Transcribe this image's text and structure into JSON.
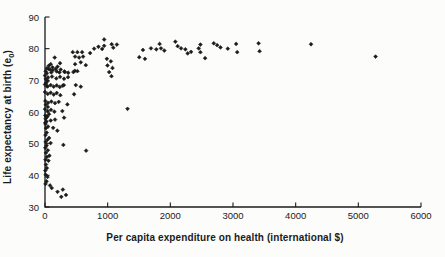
{
  "figure": {
    "background": "#fcfcfb",
    "ink": "#1b1b1b"
  },
  "chart_data": {
    "type": "scatter",
    "title": "",
    "xlabel": "Per capita expenditure on health (international $)",
    "ylabel": "Life expectancy at birth (e0)",
    "ylabel_parts": {
      "main": "Life expectancy at birth (e",
      "sub": "0",
      "close": ")"
    },
    "xlim": [
      0,
      6000
    ],
    "ylim": [
      30,
      90
    ],
    "x_ticks": [
      0,
      1000,
      2000,
      3000,
      4000,
      5000,
      6000
    ],
    "y_ticks": [
      30,
      40,
      50,
      60,
      70,
      80,
      90
    ],
    "grid": false,
    "legend": null,
    "marker": "diamond",
    "marker_color": "#1b1b1b",
    "points": [
      [
        5275,
        77.5
      ],
      [
        4245,
        81.4
      ],
      [
        3408,
        81.7
      ],
      [
        3424,
        79.2
      ],
      [
        3050,
        81.5
      ],
      [
        3067,
        78.9
      ],
      [
        2917,
        80.0
      ],
      [
        2800,
        80.4
      ],
      [
        2747,
        81.1
      ],
      [
        2693,
        81.7
      ],
      [
        2555,
        77.0
      ],
      [
        2480,
        81.3
      ],
      [
        2480,
        78.9
      ],
      [
        2453,
        80.1
      ],
      [
        2331,
        79.0
      ],
      [
        2277,
        78.5
      ],
      [
        2240,
        79.8
      ],
      [
        2171,
        80.1
      ],
      [
        2117,
        80.8
      ],
      [
        2080,
        82.2
      ],
      [
        1563,
        79.6
      ],
      [
        1691,
        80.1
      ],
      [
        1776,
        79.8
      ],
      [
        1829,
        81.5
      ],
      [
        1851,
        80.1
      ],
      [
        1904,
        79.4
      ],
      [
        1504,
        77.3
      ],
      [
        1595,
        76.8
      ],
      [
        1317,
        61.0
      ],
      [
        944,
        82.9
      ],
      [
        944,
        80.9
      ],
      [
        1064,
        81.4
      ],
      [
        1090,
        80.3
      ],
      [
        1147,
        81.3
      ],
      [
        720,
        78.6
      ],
      [
        784,
        80.0
      ],
      [
        853,
        80.6
      ],
      [
        912,
        79.9
      ],
      [
        987,
        76.8
      ],
      [
        1051,
        76.0
      ],
      [
        997,
        74.7
      ],
      [
        1077,
        73.9
      ],
      [
        1024,
        72.6
      ],
      [
        1061,
        71.3
      ],
      [
        443,
        78.9
      ],
      [
        517,
        78.9
      ],
      [
        592,
        78.9
      ],
      [
        480,
        77.5
      ],
      [
        544,
        77.2
      ],
      [
        608,
        77.5
      ],
      [
        651,
        74.8
      ],
      [
        480,
        75.1
      ],
      [
        571,
        75.7
      ],
      [
        491,
        68.5
      ],
      [
        571,
        68.0
      ],
      [
        517,
        72.9
      ],
      [
        475,
        73.0
      ],
      [
        464,
        65.6
      ],
      [
        453,
        72.6
      ],
      [
        656,
        47.8
      ],
      [
        293,
        49.6
      ],
      [
        155,
        77.2
      ],
      [
        240,
        75.4
      ],
      [
        197,
        54.1
      ],
      [
        357,
        62.4
      ],
      [
        277,
        60.3
      ],
      [
        304,
        58.2
      ],
      [
        245,
        65.3
      ],
      [
        300,
        68.5
      ],
      [
        310,
        72.8
      ],
      [
        370,
        72.4
      ],
      [
        230,
        72.5
      ],
      [
        187,
        72.8
      ],
      [
        251,
        73.4
      ],
      [
        315,
        72.6
      ],
      [
        180,
        70.6
      ],
      [
        240,
        71.1
      ],
      [
        304,
        70.5
      ],
      [
        368,
        71.0
      ],
      [
        187,
        68.4
      ],
      [
        235,
        67.9
      ],
      [
        283,
        68.3
      ],
      [
        187,
        66.0
      ],
      [
        160,
        62.8
      ],
      [
        219,
        63.2
      ],
      [
        150,
        60.1
      ],
      [
        160,
        57.6
      ],
      [
        200,
        74.3
      ],
      [
        170,
        73.6
      ],
      [
        91,
        75.1
      ],
      [
        60,
        74.6
      ],
      [
        120,
        74.1
      ],
      [
        30,
        73.8
      ],
      [
        80,
        73.4
      ],
      [
        11,
        72.9
      ],
      [
        59,
        73.6
      ],
      [
        123,
        73.2
      ],
      [
        100,
        72.5
      ],
      [
        30,
        72.2
      ],
      [
        0,
        71.5
      ],
      [
        48,
        70.9
      ],
      [
        112,
        71.2
      ],
      [
        20,
        69.2
      ],
      [
        42,
        69.8
      ],
      [
        12,
        70.4
      ],
      [
        0,
        68.7
      ],
      [
        43,
        68.1
      ],
      [
        91,
        68.5
      ],
      [
        139,
        68.0
      ],
      [
        32,
        68.1
      ],
      [
        0,
        66.3
      ],
      [
        43,
        65.7
      ],
      [
        91,
        66.1
      ],
      [
        139,
        65.5
      ],
      [
        5,
        63.5
      ],
      [
        48,
        62.9
      ],
      [
        101,
        63.3
      ],
      [
        12,
        62.3
      ],
      [
        0,
        60.9
      ],
      [
        43,
        60.3
      ],
      [
        96,
        60.7
      ],
      [
        45,
        61.6
      ],
      [
        91,
        57.3
      ],
      [
        27,
        58.4
      ],
      [
        5,
        58.9
      ],
      [
        64,
        59.3
      ],
      [
        10,
        57.9
      ],
      [
        35,
        58.6
      ],
      [
        8,
        56.2
      ],
      [
        48,
        55.4
      ],
      [
        15,
        54.9
      ],
      [
        28,
        53.5
      ],
      [
        8,
        52.7
      ],
      [
        65,
        51.8
      ],
      [
        38,
        51.2
      ],
      [
        10,
        50.5
      ],
      [
        90,
        50.2
      ],
      [
        25,
        49.4
      ],
      [
        5,
        48.7
      ],
      [
        45,
        47.9
      ],
      [
        15,
        47.1
      ],
      [
        70,
        46.2
      ],
      [
        30,
        45.8
      ],
      [
        8,
        44.9
      ],
      [
        55,
        44.6
      ],
      [
        15,
        43.4
      ],
      [
        30,
        42.3
      ],
      [
        5,
        41.5
      ],
      [
        40,
        39.5
      ],
      [
        10,
        40.2
      ],
      [
        25,
        38.1
      ],
      [
        8,
        37.3
      ],
      [
        80,
        36.8
      ],
      [
        107,
        36.0
      ],
      [
        200,
        34.8
      ],
      [
        260,
        33.2
      ],
      [
        285,
        35.5
      ],
      [
        335,
        33.8
      ],
      [
        5,
        56.6
      ],
      [
        22,
        57.0
      ],
      [
        130,
        55.0
      ]
    ]
  }
}
